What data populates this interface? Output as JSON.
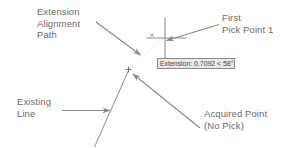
{
  "diagram": {
    "title": "Extension Alignment Path",
    "background_color": "#ffffff",
    "line_color": "#8c8c8c",
    "text_color": "#6b6b6b",
    "annotations": [
      {
        "id": "extension-alignment-path",
        "text": "Extension\nAlignment\nPath",
        "line1": "Extension",
        "line2": "Alignment",
        "line3": "Path",
        "position": "top-left",
        "leader": "arrow pointing down-right"
      },
      {
        "id": "first-pick-point",
        "text": "First\nPick Point 1",
        "line1": "First",
        "line2": "Pick Point 1",
        "position": "top-right",
        "leader": "arrow pointing left"
      },
      {
        "id": "existing-line",
        "text": "Existing\nLine",
        "line1": "Existing",
        "line2": "Line",
        "position": "bottom-left",
        "leader": "arrow pointing right"
      },
      {
        "id": "acquired-point",
        "text": "Acquired Point\n(No Pick)",
        "line1": "Acquired Point",
        "line2": "(No Pick)",
        "position": "bottom-right",
        "leader": "arrow pointing up-left"
      }
    ],
    "tooltip": {
      "text": "Extension: 0.7092 < 58°",
      "label": "Extension:",
      "distance": "0.7092",
      "angle": "58°",
      "separator": "<",
      "border_color": "#8a8a8a",
      "fill_color": "#e9e9e9"
    },
    "markers": {
      "crosshair": {
        "name": "crosshair-cursor",
        "x": 165,
        "y": 38
      },
      "tracking_x": {
        "name": "tracking-marker",
        "glyph": "×",
        "x": 152,
        "y": 36
      },
      "acquired_plus": {
        "name": "acquired-point-marker",
        "glyph": "+",
        "x": 128,
        "y": 70
      }
    }
  }
}
